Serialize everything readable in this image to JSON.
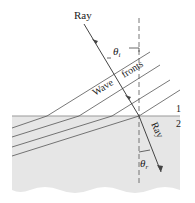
{
  "diagram": {
    "labels": {
      "ray_incident": "Ray",
      "ray_refracted": "Ray",
      "wave_word": "Wave",
      "fronts_word": "fronts",
      "theta_i": "θ",
      "theta_i_sub": "i",
      "theta_r": "θ",
      "theta_r_sub": "r",
      "medium_1": "1",
      "medium_2": "2"
    },
    "colors": {
      "medium2_fill": "#e6e6e6",
      "boundary": "#9a9a9a",
      "lines": "#555555",
      "background": "#ffffff"
    }
  }
}
